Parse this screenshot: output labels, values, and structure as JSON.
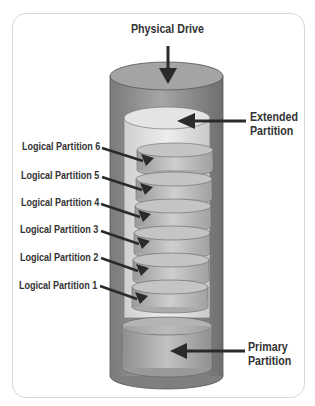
{
  "diagram": {
    "title": "Physical Drive",
    "labels": {
      "physical_drive": "Physical Drive",
      "extended_line1": "Extended",
      "extended_line2": "Partition",
      "primary_line1": "Primary",
      "primary_line2": "Partition"
    },
    "logical_partitions": [
      {
        "label": "Logical Partition 6"
      },
      {
        "label": "Logical Partition 5"
      },
      {
        "label": "Logical Partition 4"
      },
      {
        "label": "Logical Partition 3"
      },
      {
        "label": "Logical Partition 2"
      },
      {
        "label": "Logical Partition 1"
      }
    ],
    "colors": {
      "outer_cylinder": "#8a8a8a",
      "extended_partition": "#dcdcdc",
      "logical_disk": "#b4b4b4",
      "primary_partition": "#a8a8a8",
      "arrow": "#2a2a2a",
      "text": "#333333"
    }
  }
}
